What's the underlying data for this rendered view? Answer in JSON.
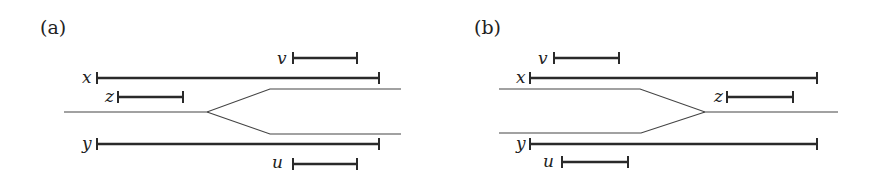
{
  "figure": {
    "panels": [
      {
        "id": "a",
        "label": "(a)",
        "track_shape": "fork-right",
        "intervals": [
          {
            "name": "v",
            "label": "v",
            "x1": 293,
            "x2": 357,
            "y": 58
          },
          {
            "name": "x",
            "label": "x",
            "x1": 97,
            "x2": 379,
            "y": 78
          },
          {
            "name": "z",
            "label": "z",
            "x1": 118,
            "x2": 183,
            "y": 97
          },
          {
            "name": "y",
            "label": "y",
            "x1": 97,
            "x2": 379,
            "y": 144
          },
          {
            "name": "u",
            "label": "u",
            "x1": 293,
            "x2": 357,
            "y": 164
          }
        ]
      },
      {
        "id": "b",
        "label": "(b)",
        "track_shape": "merge-right",
        "intervals": [
          {
            "name": "v",
            "label": "v",
            "x1": 554,
            "x2": 619,
            "y": 58
          },
          {
            "name": "x",
            "label": "x",
            "x1": 530,
            "x2": 817,
            "y": 78
          },
          {
            "name": "z",
            "label": "z",
            "x1": 727,
            "x2": 793,
            "y": 97
          },
          {
            "name": "y",
            "label": "y",
            "x1": 530,
            "x2": 817,
            "y": 144
          },
          {
            "name": "u",
            "label": "u",
            "x1": 562,
            "x2": 628,
            "y": 162
          }
        ]
      }
    ]
  }
}
